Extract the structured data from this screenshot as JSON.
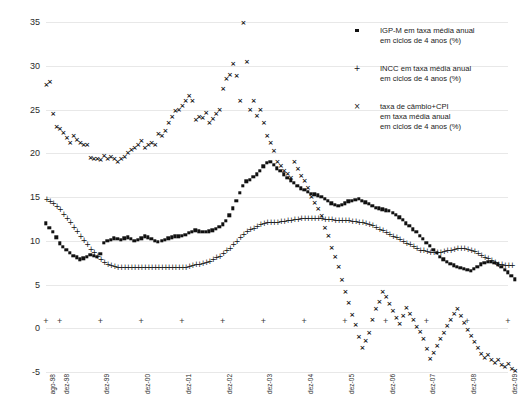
{
  "chart_data": {
    "type": "scatter",
    "title": "",
    "xlabel": "",
    "ylabel": "",
    "ylim": [
      -5,
      35
    ],
    "yticks": [
      -5,
      0,
      5,
      10,
      15,
      20,
      25,
      30,
      35
    ],
    "grid": true,
    "legend_position": "top-right",
    "xlabels": [
      "ago-98",
      "dez-98",
      "dez-99",
      "dez-00",
      "dez-01",
      "dez-02",
      "dez-03",
      "dez-04",
      "dez-05",
      "dez-06",
      "dez-07",
      "dez-08",
      "dez-09"
    ],
    "xlabel_index": [
      0,
      4,
      16,
      28,
      40,
      52,
      64,
      76,
      88,
      100,
      112,
      124,
      136
    ],
    "x_start": "ago-98",
    "x_end": "dez-09",
    "n_points": 137,
    "series": [
      {
        "name": "IGP-M em taxa média anual em ciclos de 4 anos (%)",
        "marker": "square",
        "color": "#111111",
        "values": [
          12.0,
          11.5,
          11.0,
          10.4,
          9.7,
          9.3,
          9.0,
          8.6,
          8.3,
          8.1,
          7.9,
          8.0,
          8.2,
          8.4,
          8.3,
          8.2,
          8.5,
          9.8,
          10.0,
          10.1,
          10.3,
          10.2,
          10.1,
          10.3,
          10.4,
          10.2,
          10.0,
          10.1,
          10.3,
          10.5,
          10.4,
          10.2,
          10.0,
          9.9,
          10.0,
          10.1,
          10.3,
          10.4,
          10.5,
          10.5,
          10.6,
          10.7,
          10.9,
          11.0,
          11.2,
          11.1,
          11.0,
          11.0,
          11.1,
          11.2,
          11.4,
          11.6,
          11.9,
          12.3,
          12.9,
          13.7,
          14.6,
          15.5,
          16.3,
          16.8,
          17.0,
          17.3,
          17.6,
          18.0,
          18.5,
          18.9,
          19.0,
          18.7,
          18.3,
          18.0,
          17.6,
          17.2,
          16.9,
          16.6,
          16.3,
          16.0,
          15.8,
          15.6,
          15.4,
          15.3,
          15.2,
          15.0,
          14.8,
          14.6,
          14.3,
          14.1,
          14.0,
          14.1,
          14.3,
          14.5,
          14.6,
          14.7,
          14.8,
          14.6,
          14.4,
          14.2,
          14.0,
          13.8,
          13.7,
          13.6,
          13.5,
          13.4,
          13.2,
          13.0,
          12.7,
          12.4,
          12.0,
          11.7,
          11.3,
          11.0,
          10.6,
          10.2,
          9.8,
          9.4,
          9.0,
          8.6,
          8.2,
          7.9,
          7.6,
          7.4,
          7.2,
          7.0,
          6.9,
          6.8,
          6.7,
          6.6,
          6.8,
          7.0,
          7.3,
          7.5,
          7.6,
          7.6,
          7.5,
          7.3,
          7.0,
          6.7,
          6.4,
          6.0,
          5.6
        ]
      },
      {
        "name": "INCC em taxa média anual em ciclos de 4 anos (%)",
        "marker": "plus",
        "color": "#111111",
        "values": [
          14.8,
          14.6,
          14.3,
          14.0,
          13.6,
          13.1,
          12.6,
          12.1,
          11.6,
          11.1,
          10.6,
          10.1,
          9.6,
          9.1,
          8.7,
          8.3,
          7.9,
          7.6,
          7.4,
          7.2,
          7.1,
          7.0,
          7.0,
          7.0,
          7.0,
          7.0,
          7.0,
          7.0,
          7.0,
          7.0,
          7.0,
          7.0,
          7.0,
          7.0,
          7.0,
          7.0,
          7.0,
          7.0,
          7.0,
          7.0,
          7.0,
          7.0,
          7.1,
          7.2,
          7.3,
          7.4,
          7.5,
          7.6,
          7.7,
          7.9,
          8.1,
          8.3,
          8.6,
          8.9,
          9.2,
          9.6,
          10.0,
          10.4,
          10.8,
          11.1,
          11.3,
          11.5,
          11.7,
          11.9,
          12.0,
          12.1,
          12.2,
          12.2,
          12.2,
          12.3,
          12.3,
          12.4,
          12.4,
          12.5,
          12.5,
          12.6,
          12.6,
          12.6,
          12.6,
          12.6,
          12.6,
          12.6,
          12.5,
          12.5,
          12.5,
          12.4,
          12.4,
          12.4,
          12.4,
          12.4,
          12.3,
          12.3,
          12.2,
          12.1,
          12.0,
          11.9,
          11.8,
          11.6,
          11.4,
          11.2,
          11.0,
          10.8,
          10.6,
          10.4,
          10.2,
          10.0,
          9.8,
          9.6,
          9.4,
          9.2,
          9.0,
          8.9,
          8.8,
          8.7,
          8.7,
          8.7,
          8.7,
          8.8,
          8.9,
          9.0,
          9.1,
          9.2,
          9.2,
          9.2,
          9.1,
          9.0,
          8.8,
          8.6,
          8.4,
          8.2,
          8.0,
          7.8,
          7.6,
          7.4,
          7.3,
          7.2,
          7.2,
          7.2
        ]
      },
      {
        "name": "taxa de câmbio+CPI em taxa média anual em ciclos de 4 anos (%)",
        "marker": "x",
        "color": "#111111",
        "values": [
          27.8,
          28.2,
          24.5,
          23.0,
          22.8,
          22.3,
          21.7,
          21.2,
          22.0,
          21.5,
          21.2,
          21.0,
          20.9,
          19.5,
          19.3,
          19.4,
          19.2,
          19.7,
          19.4,
          19.6,
          19.3,
          19.0,
          19.4,
          19.6,
          20.0,
          20.4,
          20.6,
          21.0,
          21.4,
          20.6,
          20.9,
          21.2,
          21.0,
          22.2,
          22.0,
          22.6,
          23.5,
          24.2,
          24.8,
          25.0,
          25.4,
          26.0,
          26.5,
          26.0,
          23.8,
          24.2,
          24.0,
          24.6,
          23.5,
          23.9,
          24.5,
          25.0,
          27.3,
          28.5,
          29.0,
          30.2,
          28.8,
          26.0,
          34.9,
          30.4,
          25.0,
          26.0,
          24.3,
          24.9,
          23.5,
          22.0,
          21.2,
          20.3,
          19.0,
          18.5,
          18.0,
          17.6,
          17.2,
          19.0,
          18.2,
          17.4,
          16.8,
          16.0,
          15.0,
          14.3,
          13.6,
          12.8,
          11.5,
          10.6,
          9.2,
          8.2,
          7.0,
          5.5,
          4.2,
          2.9,
          1.5,
          0.4,
          -1.0,
          -2.2,
          -1.5,
          -0.5,
          1.0,
          2.2,
          3.0,
          4.2,
          3.6,
          2.8,
          2.0,
          1.2,
          0.5,
          1.4,
          2.3,
          1.6,
          0.9,
          0.2,
          -0.4,
          -1.2,
          -2.4,
          -3.5,
          -2.8,
          -2.0,
          -1.2,
          -0.5,
          0.3,
          1.0,
          1.6,
          2.2,
          1.4,
          0.6,
          -0.2,
          -0.9,
          -1.6,
          -2.3,
          -2.9,
          -3.4,
          -3.0,
          -3.6,
          -4.0,
          -3.6,
          -4.2,
          -4.4,
          -4.1,
          -4.6,
          -4.9
        ]
      }
    ]
  },
  "legend": [
    {
      "marker": "square",
      "label": "IGP-M  em taxa  média anual\nem ciclos de 4 anos (%)"
    },
    {
      "marker": "plus",
      "label": "INCC em taxa  média anual\nem ciclos de 4 anos (%)"
    },
    {
      "marker": "x",
      "label": "taxa de câmbio+CPI\nem taxa  média anual\nem ciclos de 4 anos (%)"
    }
  ]
}
